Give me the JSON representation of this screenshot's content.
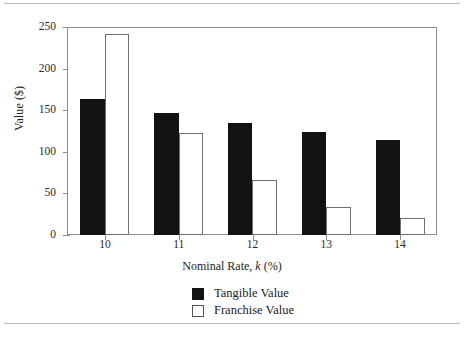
{
  "chart_data": {
    "type": "bar",
    "title": "",
    "subtitle": "",
    "xlabel_prefix": "Nominal Rate, ",
    "xlabel_italic": "k",
    "xlabel_suffix": " (%)",
    "xlabel_full": "Nominal Rate, k (%)",
    "ylabel": "Value ($)",
    "categories": [
      "10",
      "11",
      "12",
      "13",
      "14"
    ],
    "series": [
      {
        "name": "Tangible Value",
        "color": "#121212",
        "style": "filled",
        "values": [
          163,
          147,
          135,
          124,
          114
        ]
      },
      {
        "name": "Franchise Value",
        "color": "#ffffff",
        "style": "outline",
        "values": [
          242,
          123,
          66,
          34,
          20
        ]
      }
    ],
    "ylim": [
      0,
      250
    ],
    "yticks": [
      0,
      50,
      100,
      150,
      200,
      250
    ],
    "ytick_labels": [
      "0",
      "50",
      "100",
      "150",
      "200",
      "250"
    ],
    "grid": false,
    "legend_position": "bottom-center",
    "frame": true
  },
  "legend": {
    "items": [
      {
        "label": "Tangible Value",
        "swatch": "filled-square-icon"
      },
      {
        "label": "Franchise Value",
        "swatch": "outline-square-icon"
      }
    ]
  },
  "colors": {
    "tangible": "#121212",
    "franchise": "#ffffff",
    "axis": "#8d8d8d",
    "text": "#1e1e1e",
    "rule": "#b9b9b9"
  }
}
